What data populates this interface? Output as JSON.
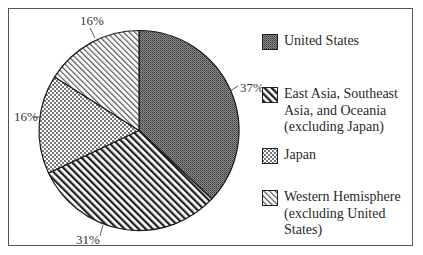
{
  "chart_data": {
    "type": "pie",
    "title": "",
    "start_angle_deg": 0,
    "direction": "clockwise",
    "categories": [
      "United States",
      "East Asia, Southeast Asia, and Oceania (excluding Japan)",
      "Japan",
      "Western Hemisphere (excluding United States)"
    ],
    "values": [
      37,
      31,
      16,
      16
    ],
    "labels": [
      "37%",
      "31%",
      "16%",
      "16%"
    ],
    "legend_position": "right"
  },
  "legend": {
    "items": [
      {
        "label": "United States",
        "pattern": "dense-dark"
      },
      {
        "label": "East Asia, Southeast\nAsia, and Oceania\n(excluding Japan)",
        "pattern": "diagonal-bold"
      },
      {
        "label": "Japan",
        "pattern": "checker"
      },
      {
        "label": "Western Hemisphere\n(excluding United\nStates)",
        "pattern": "diagonal-light"
      }
    ]
  },
  "slice_labels": {
    "us": "37%",
    "east_asia": "31%",
    "japan": "16%",
    "western": "16%"
  }
}
